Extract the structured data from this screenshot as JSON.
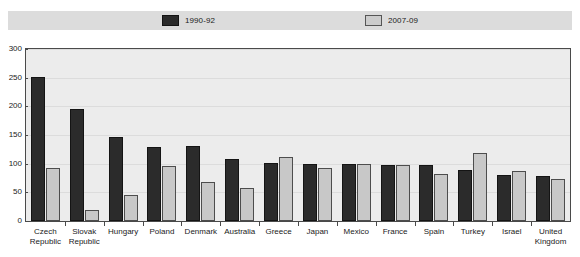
{
  "chart_data": {
    "type": "bar",
    "title": "",
    "xlabel": "",
    "ylabel": "",
    "ylim": [
      0,
      300
    ],
    "yticks": [
      0,
      50,
      100,
      150,
      200,
      250,
      300
    ],
    "grid": true,
    "legend_position": "top-center",
    "categories": [
      "Czech Republic",
      "Slovak Republic",
      "Hungary",
      "Poland",
      "Denmark",
      "Australia",
      "Greece",
      "Japan",
      "Mexico",
      "France",
      "Spain",
      "Turkey",
      "Israel",
      "United Kingdom"
    ],
    "category_lines": [
      [
        "Czech",
        "Republic"
      ],
      [
        "Slovak",
        "Republic"
      ],
      [
        "Hungary"
      ],
      [
        "Poland"
      ],
      [
        "Denmark"
      ],
      [
        "Australia"
      ],
      [
        "Greece"
      ],
      [
        "Japan"
      ],
      [
        "Mexico"
      ],
      [
        "France"
      ],
      [
        "Spain"
      ],
      [
        "Turkey"
      ],
      [
        "Israel"
      ],
      [
        "United",
        "Kingdom"
      ]
    ],
    "series": [
      {
        "name": "1990-92",
        "color": "#2b2b2b",
        "values": [
          252,
          196,
          146,
          129,
          130,
          109,
          102,
          100,
          99,
          98,
          98,
          89,
          81,
          79
        ]
      },
      {
        "name": "2007-09",
        "color": "#c8c8c8",
        "values": [
          92,
          20,
          45,
          96,
          68,
          57,
          111,
          93,
          99,
          98,
          82,
          118,
          88,
          74
        ]
      }
    ]
  },
  "legend": {
    "items": [
      {
        "label": "1990-92",
        "swatch": "dark-square-swatch"
      },
      {
        "label": "2007-09",
        "swatch": "light-square-swatch"
      }
    ]
  },
  "colors": {
    "series_1990_92": "#2b2b2b",
    "series_2007_09": "#c8c8c8",
    "plot_background": "#ececec",
    "legend_background": "#dcdcdc",
    "axis": "#4a4a4a",
    "gridline": "#dcdcdc"
  }
}
